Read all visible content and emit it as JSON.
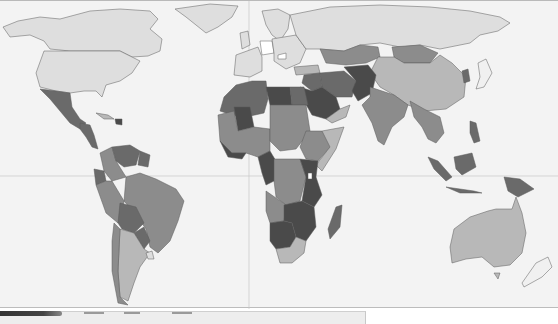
{
  "map": {
    "type": "choropleth-world-map",
    "color_scheme": "grayscale",
    "background_color": "#f3f3f3",
    "ocean_color": "#f3f3f3",
    "grid_lines": {
      "equator_y": 175,
      "prime_meridian_x": 249,
      "color": "#c7c7c7"
    },
    "shade_levels": {
      "level_0_white": "#ffffff",
      "level_1_lightest": "#dedede",
      "level_2_light": "#b8b8b8",
      "level_3_medium": "#8c8c8c",
      "level_4_dark": "#6a6a6a",
      "level_5_darkest": "#4a4a4a"
    },
    "regions": [
      {
        "name": "Canada",
        "shade": "#dedede"
      },
      {
        "name": "United States",
        "shade": "#dedede"
      },
      {
        "name": "Greenland",
        "shade": "#dedede"
      },
      {
        "name": "Mexico",
        "shade": "#6a6a6a"
      },
      {
        "name": "Central America",
        "shade": "#6a6a6a"
      },
      {
        "name": "Haiti",
        "shade": "#4a4a4a"
      },
      {
        "name": "Venezuela",
        "shade": "#6a6a6a"
      },
      {
        "name": "Colombia",
        "shade": "#8c8c8c"
      },
      {
        "name": "Ecuador",
        "shade": "#6a6a6a"
      },
      {
        "name": "Peru",
        "shade": "#8c8c8c"
      },
      {
        "name": "Brazil",
        "shade": "#8c8c8c"
      },
      {
        "name": "Bolivia",
        "shade": "#6a6a6a"
      },
      {
        "name": "Paraguay",
        "shade": "#6a6a6a"
      },
      {
        "name": "Argentina",
        "shade": "#b8b8b8"
      },
      {
        "name": "Chile",
        "shade": "#8c8c8c"
      },
      {
        "name": "Europe",
        "shade": "#dedede"
      },
      {
        "name": "Germany",
        "shade": "#ffffff"
      },
      {
        "name": "Russia",
        "shade": "#dedede"
      },
      {
        "name": "North Africa",
        "shade": "#6a6a6a"
      },
      {
        "name": "Libya",
        "shade": "#4a4a4a"
      },
      {
        "name": "West Africa",
        "shade": "#6a6a6a"
      },
      {
        "name": "Central Africa",
        "shade": "#8c8c8c"
      },
      {
        "name": "East Africa",
        "shade": "#4a4a4a"
      },
      {
        "name": "Southern Africa",
        "shade": "#4a4a4a"
      },
      {
        "name": "South Africa",
        "shade": "#b8b8b8"
      },
      {
        "name": "Madagascar",
        "shade": "#6a6a6a"
      },
      {
        "name": "Middle East",
        "shade": "#6a6a6a"
      },
      {
        "name": "Saudi Arabia",
        "shade": "#4a4a4a"
      },
      {
        "name": "Central Asia",
        "shade": "#8c8c8c"
      },
      {
        "name": "Mongolia",
        "shade": "#8c8c8c"
      },
      {
        "name": "China",
        "shade": "#b8b8b8"
      },
      {
        "name": "India",
        "shade": "#8c8c8c"
      },
      {
        "name": "Pakistan/Afghanistan",
        "shade": "#4a4a4a"
      },
      {
        "name": "Southeast Asia",
        "shade": "#8c8c8c"
      },
      {
        "name": "Japan",
        "shade": "#f0f0f0"
      },
      {
        "name": "Indonesia",
        "shade": "#6a6a6a"
      },
      {
        "name": "Papua New Guinea",
        "shade": "#6a6a6a"
      },
      {
        "name": "Australia",
        "shade": "#b8b8b8"
      },
      {
        "name": "New Zealand",
        "shade": "#f0f0f0"
      }
    ]
  }
}
